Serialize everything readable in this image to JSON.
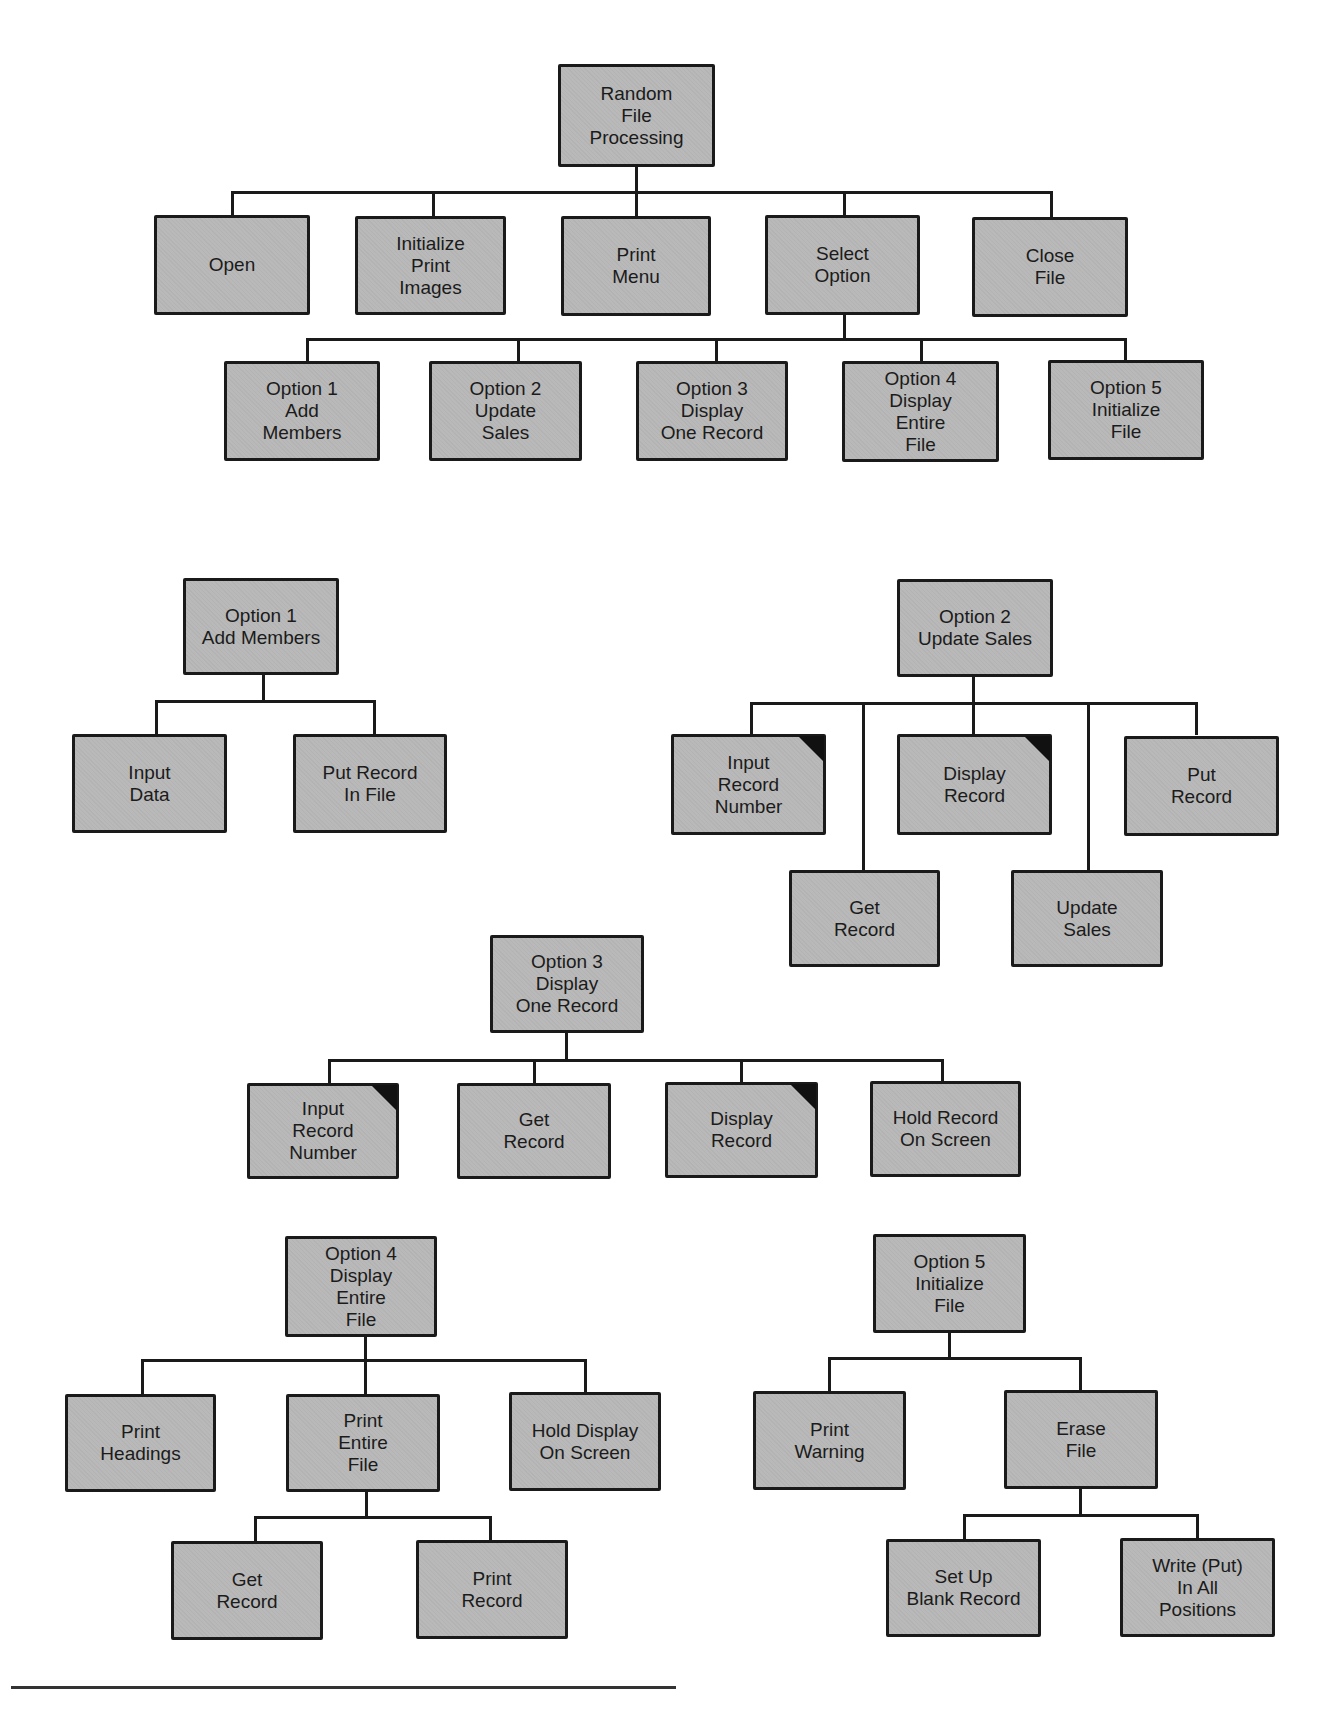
{
  "diagram": {
    "type": "hierarchy chart",
    "main_tree": {
      "root": "Random\nFile\nProcessing",
      "level1": [
        "Open",
        "Initialize\nPrint\nImages",
        "Print\nMenu",
        "Select\nOption",
        "Close\nFile"
      ],
      "level2_parent": "Select Option",
      "level2": [
        "Option 1\nAdd\nMembers",
        "Option 2\nUpdate\nSales",
        "Option 3\nDisplay\nOne Record",
        "Option 4\nDisplay\nEntire\nFile",
        "Option 5\nInitialize\nFile"
      ]
    },
    "option1": {
      "root": "Option 1\nAdd Members",
      "children": [
        "Input\nData",
        "Put Record\nIn File"
      ]
    },
    "option2": {
      "root": "Option 2\nUpdate Sales",
      "children": [
        "Input\nRecord\nNumber",
        "Get\nRecord",
        "Display\nRecord",
        "Update\nSales",
        "Put\nRecord"
      ],
      "marked_io": [
        "Input Record Number",
        "Display Record"
      ]
    },
    "option3": {
      "root": "Option 3\nDisplay\nOne Record",
      "children": [
        "Input\nRecord\nNumber",
        "Get\nRecord",
        "Display\nRecord",
        "Hold Record\nOn Screen"
      ],
      "marked_io": [
        "Input Record Number",
        "Display Record"
      ]
    },
    "option4": {
      "root": "Option 4\nDisplay\nEntire\nFile",
      "children": [
        "Print\nHeadings",
        "Print\nEntire\nFile",
        "Hold Display\nOn Screen"
      ],
      "print_entire_children": [
        "Get\nRecord",
        "Print\nRecord"
      ]
    },
    "option5": {
      "root": "Option 5\nInitialize\nFile",
      "children": [
        "Print\nWarning",
        "Erase\nFile"
      ],
      "erase_children": [
        "Set Up\nBlank Record",
        "Write (Put)\nIn All\nPositions"
      ]
    }
  },
  "colors": {
    "box_fill": "#b9b9b9",
    "border": "#1a1a1a",
    "corner_marker": "#111111"
  }
}
